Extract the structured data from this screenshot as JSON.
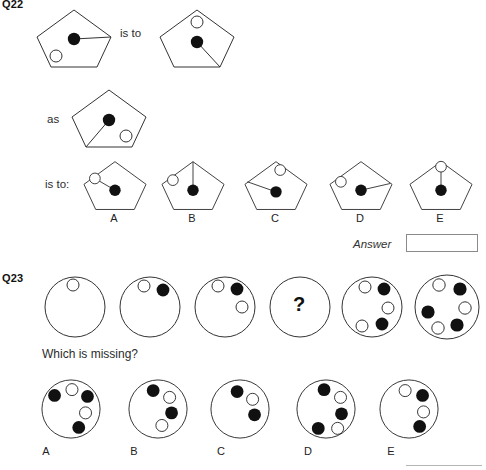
{
  "page": {
    "background": "#ffffff",
    "stroke_color": "#333333",
    "fill_dot_color": "#111111",
    "open_dot_color": "#ffffff"
  },
  "q22": {
    "label": "Q22",
    "connector_is_to": "is to",
    "connector_as": "as",
    "connector_is_to_colon": "is to:",
    "answer_label": "Answer",
    "answer_value": "",
    "stem": {
      "left": {
        "name": "pentagon-stem-left",
        "dot": "center",
        "line_to_vertex": "right",
        "open_circle_at": "lower-left"
      },
      "right": {
        "name": "pentagon-stem-right",
        "dot": "center",
        "line_to_vertex": "bottom-right",
        "open_circle_at": "top"
      },
      "as": {
        "name": "pentagon-stem-as",
        "dot": "center",
        "line_to_vertex": "bottom-left",
        "open_circle_at": "lower-right"
      }
    },
    "options": [
      {
        "letter": "A",
        "dot": "center",
        "line_to_vertex": "upper-left",
        "open_circle_at": "upper-left"
      },
      {
        "letter": "B",
        "dot": "center",
        "line_to_vertex": "top",
        "open_circle_at": "upper-left"
      },
      {
        "letter": "C",
        "dot": "center",
        "line_to_vertex": "upper-left",
        "open_circle_at": "top-right"
      },
      {
        "letter": "D",
        "dot": "center",
        "line_to_vertex": "right",
        "open_circle_at": "upper-left"
      },
      {
        "letter": "E",
        "dot": "center",
        "line_to_vertex": "top",
        "open_circle_at": "top"
      }
    ]
  },
  "q23": {
    "label": "Q23",
    "prompt": "Which is missing?",
    "missing_marker": "?",
    "sequence": [
      {
        "index": 1,
        "dots": [
          "open"
        ],
        "missing": false
      },
      {
        "index": 2,
        "dots": [
          "open",
          "filled"
        ],
        "missing": false
      },
      {
        "index": 3,
        "dots": [
          "open",
          "filled",
          "open"
        ],
        "missing": false
      },
      {
        "index": 4,
        "dots": [],
        "missing": true
      },
      {
        "index": 5,
        "dots": [
          "open",
          "filled",
          "open",
          "filled",
          "open"
        ],
        "missing": false
      },
      {
        "index": 6,
        "dots": [
          "open",
          "filled",
          "open",
          "filled",
          "open",
          "filled"
        ],
        "missing": false
      }
    ],
    "options": [
      {
        "letter": "A",
        "dots": [
          "filled",
          "open",
          "filled",
          "open",
          "filled"
        ]
      },
      {
        "letter": "B",
        "dots": [
          "filled",
          "open",
          "filled",
          "open"
        ]
      },
      {
        "letter": "C",
        "dots": [
          "filled",
          "open",
          "filled"
        ]
      },
      {
        "letter": "D",
        "dots": [
          "filled",
          "open",
          "filled",
          "open",
          "filled"
        ]
      },
      {
        "letter": "E",
        "dots": [
          "open",
          "filled",
          "open",
          "filled"
        ]
      }
    ]
  }
}
